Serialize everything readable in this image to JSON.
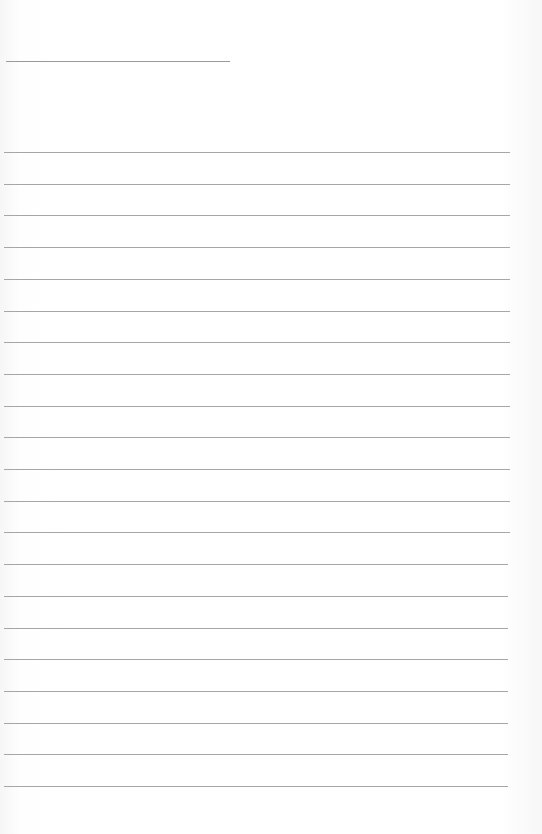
{
  "page": {
    "type": "lined-paper",
    "title_line": {
      "x": 6,
      "y": 61,
      "width": 224
    },
    "rules": {
      "count": 21,
      "first_y": 152,
      "spacing": 31.7,
      "x": 4,
      "width": 506,
      "color": "#a6a6a6"
    },
    "background_color": "#ffffff"
  }
}
